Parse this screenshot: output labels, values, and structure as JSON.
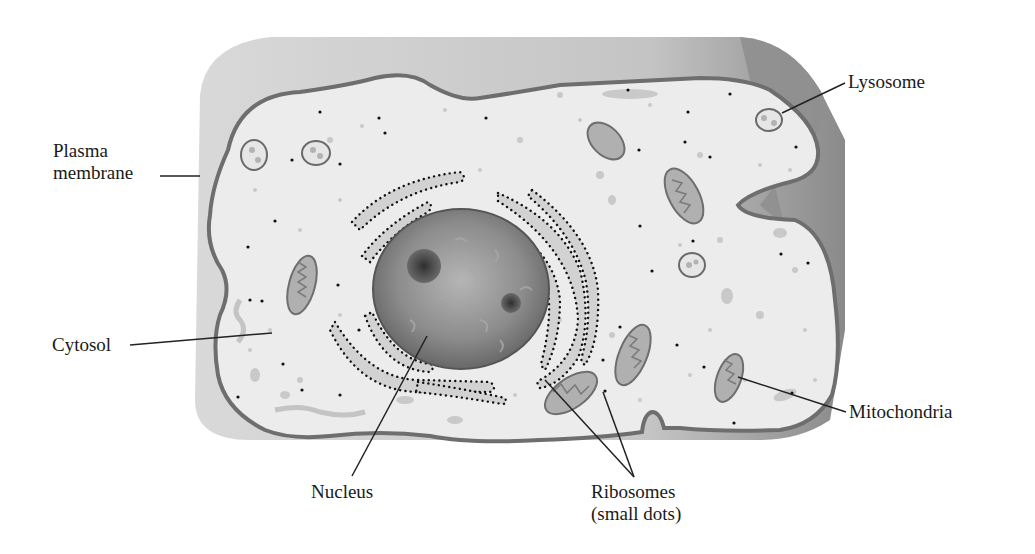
{
  "labels": {
    "plasma_membrane": [
      "Plasma",
      "membrane"
    ],
    "lysosome": "Lysosome",
    "cytosol": "Cytosol",
    "mitochondria": "Mitochondria",
    "nucleus": "Nucleus",
    "ribosomes": [
      "Ribosomes",
      "(small dots)"
    ]
  },
  "colors": {
    "background": "#ffffff",
    "cell_side": "#c9c9c9",
    "cell_side_dark": "#8e8e8e",
    "cytosol": "#ececec",
    "membrane": "#6e6e6e",
    "organelle_fill": "#b8b8b8",
    "nucleus": "#777777",
    "nucleolus": "#4a4a4a",
    "ribosome": "#111111",
    "leader_line": "#222222"
  }
}
